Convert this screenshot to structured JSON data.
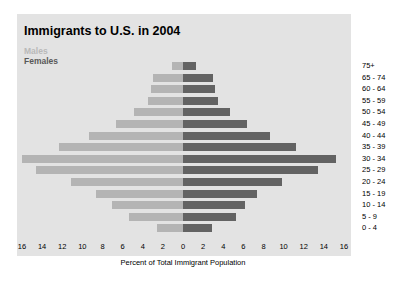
{
  "chart_data": {
    "type": "bar",
    "title": "Immigrants to U.S. in 2004",
    "xlabel": "Percent of Total Immigrant Population",
    "ylabel": "",
    "orientation": "horizontal",
    "subtype": "population-pyramid",
    "xlim": [
      0,
      16
    ],
    "xticks": [
      "16",
      "14",
      "12",
      "10",
      "8",
      "6",
      "4",
      "2",
      "0",
      "2",
      "4",
      "6",
      "8",
      "10",
      "12",
      "14",
      "16"
    ],
    "categories": [
      "0 - 4",
      "5 - 9",
      "10 - 14",
      "15 - 19",
      "20 - 24",
      "25 - 29",
      "30 - 34",
      "35 - 39",
      "40 - 44",
      "45 - 49",
      "50 - 54",
      "55 - 59",
      "60 - 64",
      "65 - 74",
      "75+"
    ],
    "legend": [
      "Males",
      "Females"
    ],
    "legend_position": "top-left",
    "grid": false,
    "series": [
      {
        "name": "Males",
        "color": "#b4b4b4",
        "side": "left",
        "values": [
          2.6,
          5.4,
          7.1,
          8.6,
          11.1,
          14.6,
          16.0,
          12.3,
          9.3,
          6.7,
          4.9,
          3.5,
          3.2,
          3.0,
          1.1
        ]
      },
      {
        "name": "Females",
        "color": "#636363",
        "side": "right",
        "values": [
          2.9,
          5.3,
          6.2,
          7.4,
          9.8,
          13.4,
          15.2,
          11.2,
          8.6,
          6.4,
          4.7,
          3.5,
          3.2,
          3.0,
          1.3
        ]
      }
    ]
  }
}
